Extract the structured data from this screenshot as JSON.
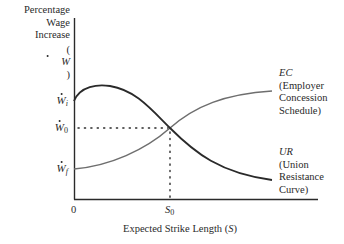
{
  "diagram": {
    "y_axis": {
      "title_lines": [
        "Percentage",
        "Wage",
        "Increase"
      ],
      "symbol": "W",
      "symbol_open": "(",
      "symbol_close": ")"
    },
    "x_axis": {
      "title_text": "Expected Strike Length (",
      "title_symbol": "S",
      "title_close": ")",
      "origin_label": "0",
      "tick_label": "S",
      "tick_sub": "0"
    },
    "y_ticks": [
      {
        "symbol": "W",
        "sub": "i",
        "meaning": "initial union demand"
      },
      {
        "symbol": "W",
        "sub": "0",
        "meaning": "settlement wage"
      },
      {
        "symbol": "W",
        "sub": "f",
        "meaning": "initial employer offer"
      }
    ],
    "curves": {
      "ec": {
        "abbr": "EC",
        "desc_lines": [
          "(Employer",
          "Concession",
          "Schedule)"
        ],
        "color": "#6e6e6e"
      },
      "ur": {
        "abbr": "UR",
        "desc_lines": [
          "(Union",
          "Resistance",
          "Curve)"
        ],
        "color": "#2a2a2a"
      }
    },
    "colors": {
      "axis": "#2a2a2a",
      "ec_curve": "#6e6e6e",
      "ur_curve": "#2a2a2a",
      "guides": "#2a2a2a"
    }
  }
}
